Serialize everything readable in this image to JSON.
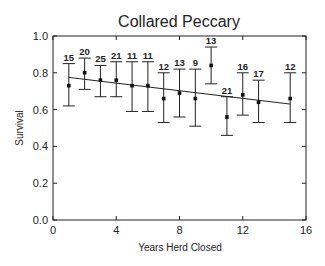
{
  "chart_data": {
    "type": "scatter",
    "title": "Collared Peccary",
    "xlabel": "Years Herd Closed",
    "ylabel": "Survival",
    "xlim": [
      0,
      16
    ],
    "ylim": [
      0.0,
      1.0
    ],
    "xticks": [
      0,
      4,
      8,
      12,
      16
    ],
    "xtick_labels": [
      "0",
      "4",
      "8",
      "12",
      "16"
    ],
    "yticks": [
      0.0,
      0.2,
      0.4,
      0.6,
      0.8,
      1.0
    ],
    "ytick_labels": [
      "0.0",
      "0.2",
      "0.4",
      "0.6",
      "0.8",
      "1.0"
    ],
    "grid": false,
    "legend": null,
    "points": [
      {
        "x": 1,
        "y": 0.73,
        "upper": 0.85,
        "lower": 0.62,
        "n": "15"
      },
      {
        "x": 2,
        "y": 0.8,
        "upper": 0.88,
        "lower": 0.71,
        "n": "20"
      },
      {
        "x": 3,
        "y": 0.76,
        "upper": 0.84,
        "lower": 0.67,
        "n": "25"
      },
      {
        "x": 4,
        "y": 0.76,
        "upper": 0.86,
        "lower": 0.67,
        "n": "21"
      },
      {
        "x": 5,
        "y": 0.73,
        "upper": 0.86,
        "lower": 0.59,
        "n": "11"
      },
      {
        "x": 6,
        "y": 0.73,
        "upper": 0.86,
        "lower": 0.59,
        "n": "11"
      },
      {
        "x": 7,
        "y": 0.66,
        "upper": 0.8,
        "lower": 0.53,
        "n": "12"
      },
      {
        "x": 8,
        "y": 0.69,
        "upper": 0.82,
        "lower": 0.56,
        "n": "13"
      },
      {
        "x": 9,
        "y": 0.66,
        "upper": 0.82,
        "lower": 0.51,
        "n": "9"
      },
      {
        "x": 10,
        "y": 0.84,
        "upper": 0.94,
        "lower": 0.74,
        "n": "13"
      },
      {
        "x": 11,
        "y": 0.56,
        "upper": 0.67,
        "lower": 0.46,
        "n": "21"
      },
      {
        "x": 12,
        "y": 0.68,
        "upper": 0.8,
        "lower": 0.57,
        "n": "16"
      },
      {
        "x": 13,
        "y": 0.64,
        "upper": 0.76,
        "lower": 0.53,
        "n": "17"
      },
      {
        "x": 15,
        "y": 0.66,
        "upper": 0.8,
        "lower": 0.53,
        "n": "12"
      }
    ],
    "regression_line": {
      "x": [
        1,
        15
      ],
      "y": [
        0.775,
        0.63
      ]
    }
  }
}
